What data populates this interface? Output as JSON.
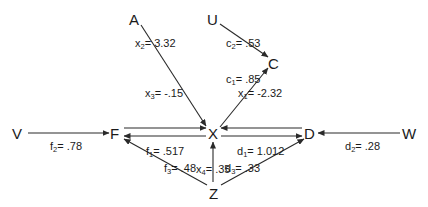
{
  "diagram": {
    "type": "path-diagram",
    "nodes": [
      {
        "id": "A",
        "label": "A",
        "x": 135,
        "y": 20
      },
      {
        "id": "U",
        "label": "U",
        "x": 213,
        "y": 20
      },
      {
        "id": "C",
        "label": "C",
        "x": 274,
        "y": 63
      },
      {
        "id": "V",
        "label": "V",
        "x": 18,
        "y": 134
      },
      {
        "id": "F",
        "label": "F",
        "x": 116,
        "y": 134
      },
      {
        "id": "X",
        "label": "X",
        "x": 213,
        "y": 134
      },
      {
        "id": "D",
        "label": "D",
        "x": 309,
        "y": 134
      },
      {
        "id": "W",
        "label": "W",
        "x": 409,
        "y": 134
      },
      {
        "id": "Z",
        "label": "Z",
        "x": 214,
        "y": 192
      }
    ],
    "edges": [
      {
        "from": "A",
        "to": "X",
        "coef": "x",
        "sub": "2",
        "value": "3.32"
      },
      {
        "from": "U",
        "to": "C",
        "coef": "c",
        "sub": "2",
        "value": ".53"
      },
      {
        "from": "X",
        "to": "C",
        "coef": "c",
        "sub": "1",
        "value": ".85"
      },
      {
        "from": "F",
        "to": "X",
        "coef": "x",
        "sub": "3",
        "value": "-.15"
      },
      {
        "from": "X",
        "to": "F",
        "coef": "f",
        "sub": "1",
        "value": ".517"
      },
      {
        "from": "D",
        "to": "X",
        "coef": "x",
        "sub": "1",
        "value": "-2.32"
      },
      {
        "from": "X",
        "to": "D",
        "coef": "d",
        "sub": "1",
        "value": "1.012"
      },
      {
        "from": "V",
        "to": "F",
        "coef": "f",
        "sub": "2",
        "value": ".78"
      },
      {
        "from": "W",
        "to": "D",
        "coef": "d",
        "sub": "2",
        "value": ".28"
      },
      {
        "from": "Z",
        "to": "X",
        "coef": "x",
        "sub": "4",
        "value": ".35"
      },
      {
        "from": "Z",
        "to": "F",
        "coef": "f",
        "sub": "3",
        "value": ".48"
      },
      {
        "from": "Z",
        "to": "D",
        "coef": "d",
        "sub": "3",
        "value": ".33"
      }
    ]
  },
  "labels": {
    "A": "A",
    "U": "U",
    "C": "C",
    "V": "V",
    "F": "F",
    "X": "X",
    "D": "D",
    "W": "W",
    "Z": "Z",
    "x2": {
      "sym": "x",
      "sub": "2",
      "val": "= 3.32"
    },
    "c2": {
      "sym": "c",
      "sub": "2",
      "val": "= .53"
    },
    "c1": {
      "sym": "c",
      "sub": "1",
      "val": "= .85"
    },
    "x3": {
      "sym": "x",
      "sub": "3",
      "val": "= -.15"
    },
    "x1": {
      "sym": "x",
      "sub": "1",
      "val": "= -2.32"
    },
    "f1": {
      "sym": "f",
      "sub": "1",
      "val": "= .517"
    },
    "d1": {
      "sym": "d",
      "sub": "1",
      "val": "= 1.012"
    },
    "f2": {
      "sym": "f",
      "sub": "2",
      "val": "= .78"
    },
    "d2": {
      "sym": "d",
      "sub": "2",
      "val": "= .28"
    },
    "x4": {
      "sym": "x",
      "sub": "4",
      "val": "= .35"
    },
    "f3": {
      "sym": "f",
      "sub": "3",
      "val": "= .48"
    },
    "d3": {
      "sym": "d",
      "sub": "3",
      "val": "= .33"
    }
  },
  "colors": {
    "ink": "#1a1a1a",
    "background": "#ffffff"
  }
}
